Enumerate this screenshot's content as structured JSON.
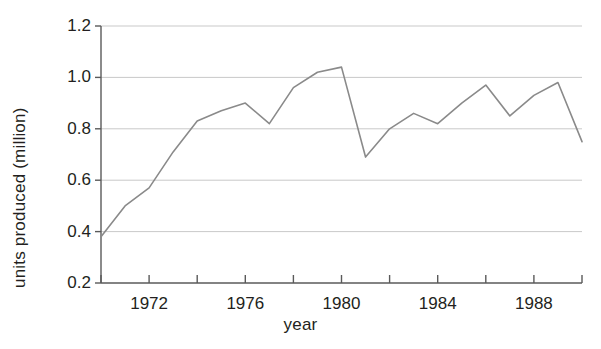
{
  "chart_data": {
    "type": "line",
    "title": "",
    "xlabel": "year",
    "ylabel": "units produced (million)",
    "xlim": [
      1970,
      1990
    ],
    "ylim": [
      0.2,
      1.2
    ],
    "grid": true,
    "legend": "none",
    "x_tick_labels": [
      "1972",
      "1976",
      "1980",
      "1984",
      "1988"
    ],
    "x_tick_values": [
      1972,
      1976,
      1980,
      1984,
      1988
    ],
    "x_minor_ticks": [
      1970,
      1974,
      1978,
      1982,
      1986,
      1990
    ],
    "y_tick_labels": [
      "0.2",
      "0.4",
      "0.6",
      "0.8",
      "1.0",
      "1.2"
    ],
    "y_tick_values": [
      0.2,
      0.4,
      0.6,
      0.8,
      1.0,
      1.2
    ],
    "x": [
      1970,
      1971,
      1972,
      1973,
      1974,
      1975,
      1976,
      1977,
      1978,
      1979,
      1980,
      1981,
      1982,
      1983,
      1984,
      1985,
      1986,
      1987,
      1988,
      1989,
      1990
    ],
    "values": [
      0.38,
      0.5,
      0.57,
      0.71,
      0.83,
      0.87,
      0.9,
      0.82,
      0.96,
      1.02,
      1.04,
      0.69,
      0.8,
      0.86,
      0.82,
      0.9,
      0.97,
      0.85,
      0.93,
      0.98,
      0.75
    ],
    "series": [
      {
        "name": "units produced",
        "values": [
          0.38,
          0.5,
          0.57,
          0.71,
          0.83,
          0.87,
          0.9,
          0.82,
          0.96,
          1.02,
          1.04,
          0.69,
          0.8,
          0.86,
          0.82,
          0.9,
          0.97,
          0.85,
          0.93,
          0.98,
          0.75
        ]
      }
    ],
    "line_color": "#8a8a8a",
    "grid_color": "#c9c9c9",
    "axis_color": "#5a5a5a",
    "background": "#ffffff"
  }
}
